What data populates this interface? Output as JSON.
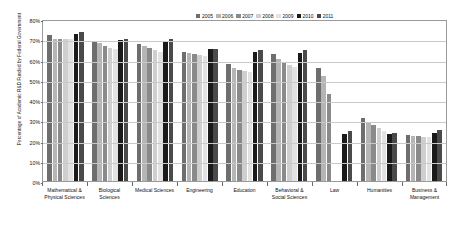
{
  "chart_data": {
    "type": "bar",
    "title": "",
    "xlabel": "",
    "ylabel": "Percentage of Academic R&D Funded by Federal Government",
    "ylim": [
      0,
      80
    ],
    "ytick_labels": [
      "80%",
      "70%",
      "60%",
      "50%",
      "40%",
      "30%",
      "20%",
      "10%",
      "0%"
    ],
    "ytick_values": [
      80,
      70,
      60,
      50,
      40,
      30,
      20,
      10,
      0
    ],
    "grid": true,
    "legend_position": "top-right",
    "categories": [
      "Mathematical & Physical Sciences",
      "Biological Sciences",
      "Medical Sciences",
      "Engineering",
      "Education",
      "Behavioral & Social Sciences",
      "Law",
      "Humanities",
      "Business & Management"
    ],
    "series": [
      {
        "name": "2005",
        "color": "#6e6e6e",
        "values": [
          72.0,
          68.5,
          67.5,
          63.5,
          58.0,
          62.5,
          56.0,
          31.0,
          22.5
        ]
      },
      {
        "name": "2006",
        "color": "#b5b5b5",
        "values": [
          70.0,
          68.0,
          66.5,
          63.0,
          56.0,
          60.5,
          52.0,
          29.0,
          22.0
        ]
      },
      {
        "name": "2007",
        "color": "#8a8a8a",
        "values": [
          70.0,
          66.5,
          65.5,
          62.5,
          55.0,
          58.5,
          43.0,
          27.5,
          22.0
        ]
      },
      {
        "name": "2008",
        "color": "#cfcfcf",
        "values": [
          70.0,
          65.5,
          64.5,
          62.0,
          54.5,
          57.5,
          null,
          26.0,
          21.5
        ]
      },
      {
        "name": "2009",
        "color": "#e2e2e2",
        "values": [
          70.0,
          65.0,
          63.5,
          61.5,
          54.0,
          56.5,
          null,
          24.5,
          21.5
        ]
      },
      {
        "name": "2010",
        "color": "#1a1a1a",
        "values": [
          72.5,
          69.5,
          69.0,
          65.0,
          63.5,
          63.0,
          23.0,
          23.0,
          23.5
        ]
      },
      {
        "name": "2011",
        "color": "#4a4a4a",
        "values": [
          73.5,
          70.0,
          70.0,
          65.0,
          64.5,
          64.5,
          24.5,
          23.5,
          25.0
        ]
      }
    ]
  }
}
